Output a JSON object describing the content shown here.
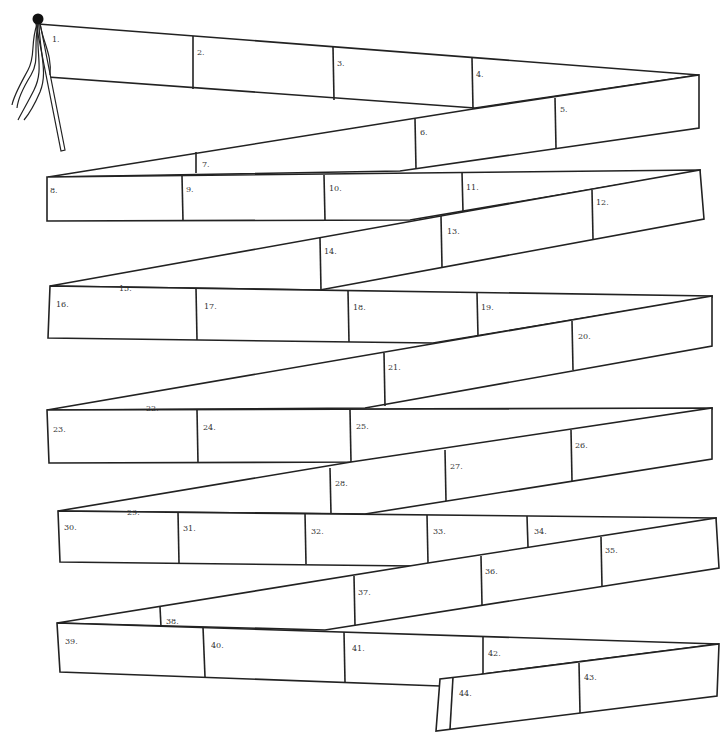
{
  "board": {
    "title": "Zig-zag ribbon game board",
    "colors": {
      "line": "#222222",
      "background": "#ffffff",
      "label": "#333333"
    },
    "start_marker": "flag-with-streamers-icon",
    "squares": [
      {
        "n": "1.",
        "x": 52,
        "y": 34
      },
      {
        "n": "2.",
        "x": 197,
        "y": 47
      },
      {
        "n": "3.",
        "x": 337,
        "y": 58
      },
      {
        "n": "4.",
        "x": 476,
        "y": 69
      },
      {
        "n": "5.",
        "x": 560,
        "y": 104
      },
      {
        "n": "6.",
        "x": 420,
        "y": 127
      },
      {
        "n": "7.",
        "x": 202,
        "y": 159
      },
      {
        "n": "8.",
        "x": 50,
        "y": 185
      },
      {
        "n": "9.",
        "x": 186,
        "y": 184
      },
      {
        "n": "10.",
        "x": 329,
        "y": 183
      },
      {
        "n": "11.",
        "x": 466,
        "y": 182
      },
      {
        "n": "12.",
        "x": 596,
        "y": 197
      },
      {
        "n": "13.",
        "x": 447,
        "y": 226
      },
      {
        "n": "14.",
        "x": 324,
        "y": 246
      },
      {
        "n": "15.",
        "x": 119,
        "y": 283
      },
      {
        "n": "16.",
        "x": 56,
        "y": 299
      },
      {
        "n": "17.",
        "x": 204,
        "y": 301
      },
      {
        "n": "18.",
        "x": 353,
        "y": 302
      },
      {
        "n": "19.",
        "x": 481,
        "y": 302
      },
      {
        "n": "20.",
        "x": 578,
        "y": 331
      },
      {
        "n": "21.",
        "x": 388,
        "y": 362
      },
      {
        "n": "22.",
        "x": 146,
        "y": 403
      },
      {
        "n": "23.",
        "x": 53,
        "y": 424
      },
      {
        "n": "24.",
        "x": 203,
        "y": 422
      },
      {
        "n": "25.",
        "x": 356,
        "y": 421
      },
      {
        "n": "26.",
        "x": 575,
        "y": 440
      },
      {
        "n": "27.",
        "x": 450,
        "y": 461
      },
      {
        "n": "28.",
        "x": 335,
        "y": 478
      },
      {
        "n": "29.",
        "x": 127,
        "y": 507
      },
      {
        "n": "30.",
        "x": 64,
        "y": 522
      },
      {
        "n": "31.",
        "x": 183,
        "y": 523
      },
      {
        "n": "32.",
        "x": 311,
        "y": 526
      },
      {
        "n": "33.",
        "x": 433,
        "y": 526
      },
      {
        "n": "34.",
        "x": 534,
        "y": 526
      },
      {
        "n": "35.",
        "x": 605,
        "y": 545
      },
      {
        "n": "36.",
        "x": 485,
        "y": 566
      },
      {
        "n": "37.",
        "x": 358,
        "y": 587
      },
      {
        "n": "38.",
        "x": 166,
        "y": 616
      },
      {
        "n": "39.",
        "x": 65,
        "y": 636
      },
      {
        "n": "40.",
        "x": 211,
        "y": 640
      },
      {
        "n": "41.",
        "x": 352,
        "y": 643
      },
      {
        "n": "42.",
        "x": 488,
        "y": 648
      },
      {
        "n": "43.",
        "x": 584,
        "y": 672
      },
      {
        "n": "44.",
        "x": 459,
        "y": 688
      }
    ]
  }
}
